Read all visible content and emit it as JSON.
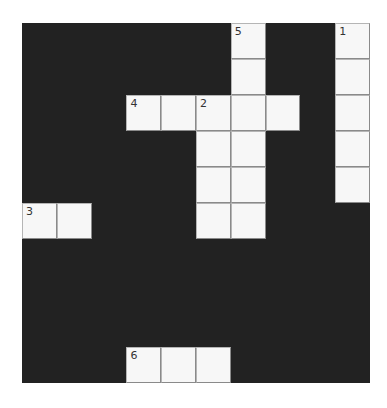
{
  "puzzle": {
    "rows": 10,
    "cols": 10,
    "colors": {
      "block": "#222222",
      "cell": "#f7f7f7",
      "gridline": "#8a8a8a"
    },
    "white_cells": [
      [
        0,
        6
      ],
      [
        0,
        9
      ],
      [
        1,
        6
      ],
      [
        1,
        9
      ],
      [
        2,
        3
      ],
      [
        2,
        4
      ],
      [
        2,
        5
      ],
      [
        2,
        6
      ],
      [
        2,
        7
      ],
      [
        2,
        9
      ],
      [
        3,
        5
      ],
      [
        3,
        6
      ],
      [
        3,
        9
      ],
      [
        4,
        5
      ],
      [
        4,
        6
      ],
      [
        4,
        9
      ],
      [
        5,
        0
      ],
      [
        5,
        1
      ],
      [
        5,
        5
      ],
      [
        5,
        6
      ],
      [
        9,
        3
      ],
      [
        9,
        4
      ],
      [
        9,
        5
      ]
    ],
    "numbers": [
      {
        "row": 0,
        "col": 6,
        "label": "5"
      },
      {
        "row": 0,
        "col": 9,
        "label": "1"
      },
      {
        "row": 2,
        "col": 3,
        "label": "4"
      },
      {
        "row": 2,
        "col": 5,
        "label": "2"
      },
      {
        "row": 5,
        "col": 0,
        "label": "3"
      },
      {
        "row": 9,
        "col": 3,
        "label": "6"
      }
    ],
    "entries": {}
  }
}
